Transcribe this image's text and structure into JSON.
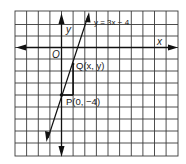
{
  "diagram": {
    "type": "coordinate-grid-graph",
    "axes": {
      "x_label": "x",
      "y_label": "y",
      "origin_label": "O"
    },
    "line": {
      "equation_label": "y = 3x − 4",
      "slope": 3,
      "intercept": -4
    },
    "points": [
      {
        "name": "Q",
        "label": "Q(x, y)"
      },
      {
        "name": "P",
        "label": "P(0, −4)"
      }
    ],
    "colors": {
      "grid": "#333333",
      "ink": "#111111",
      "background": "#ffffff"
    }
  }
}
